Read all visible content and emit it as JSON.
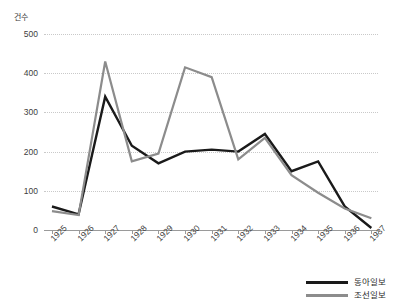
{
  "chart_data": {
    "type": "line",
    "title": "",
    "subtitle": "",
    "xlabel": "",
    "ylabel": "건수",
    "ylim": [
      0,
      500
    ],
    "yticks": [
      0,
      100,
      200,
      300,
      400,
      500
    ],
    "grid": true,
    "legend_position": "bottom-right",
    "categories": [
      "1925",
      "1926",
      "1927",
      "1928",
      "1929",
      "1930",
      "1931",
      "1932",
      "1933",
      "1934",
      "1935",
      "1936",
      "1937"
    ],
    "series": [
      {
        "name": "동아일보",
        "color": "#1a1a1a",
        "values": [
          60,
          40,
          340,
          215,
          170,
          200,
          205,
          200,
          245,
          150,
          175,
          60,
          5
        ]
      },
      {
        "name": "조선일보",
        "color": "#8c8c8c",
        "values": [
          48,
          38,
          430,
          175,
          195,
          415,
          390,
          180,
          235,
          140,
          95,
          55,
          30
        ]
      }
    ]
  },
  "axes": {
    "y_unit_label": "건수",
    "y_tick_labels": [
      "500",
      "400",
      "300",
      "200",
      "100",
      "0"
    ],
    "x_tick_labels": [
      "1925",
      "1926",
      "1927",
      "1928",
      "1929",
      "1930",
      "1931",
      "1932",
      "1933",
      "1934",
      "1935",
      "1936",
      "1937"
    ]
  },
  "legend": {
    "items": [
      {
        "label": "동아일보",
        "color": "#1a1a1a"
      },
      {
        "label": "조선일보",
        "color": "#8c8c8c"
      }
    ]
  },
  "colors": {
    "series_black": "#1a1a1a",
    "series_gray": "#8c8c8c",
    "gridline": "#c9c9c9",
    "axis": "#9a9a9a",
    "text": "#404040",
    "background": "#ffffff"
  }
}
